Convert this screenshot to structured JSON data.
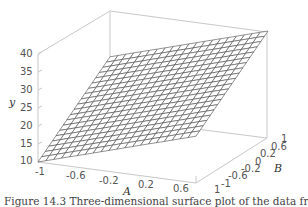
{
  "chart_data": {
    "type": "surface3d",
    "title": "",
    "xlabel": "A",
    "ylabel": "B",
    "zlabel": "y",
    "x_ticks": [
      "-1",
      "-0.6",
      "-0.2",
      "0.2",
      "0.6",
      "1"
    ],
    "y_ticks": [
      "-1",
      "-0.6",
      "-0.2",
      "0",
      "0.2",
      "0.6",
      "1"
    ],
    "z_ticks": [
      "10",
      "15",
      "20",
      "25",
      "30",
      "35",
      "40"
    ],
    "xlim": [
      -1,
      1
    ],
    "ylim": [
      -1,
      1
    ],
    "zlim": [
      10,
      40
    ],
    "grid": false,
    "surface": {
      "description": "planar wireframe surface, lowest at A=-1,B=-1 and highest at A=1,B=1",
      "corners": [
        {
          "A": -1,
          "B": -1,
          "y": 10
        },
        {
          "A": -1,
          "B": 1,
          "y": 27
        },
        {
          "A": 1,
          "B": 1,
          "y": 40
        },
        {
          "A": 1,
          "B": -1,
          "y": 23
        }
      ],
      "mesh_lines": 20
    }
  },
  "axes": {
    "z_label": "y",
    "x_label": "A",
    "y_label": "B",
    "z_ticks": [
      "40",
      "35",
      "30",
      "25",
      "20",
      "15",
      "10"
    ],
    "x_ticks": [
      "-1",
      "-0.6",
      "-0.2",
      "0.2",
      "0.6",
      "1"
    ],
    "y_ticks": [
      "-1",
      "-0.6",
      "-0.2",
      "0",
      "0.2",
      "0.6",
      "1"
    ]
  },
  "caption": "Figure 14.3   Three-dimensional surface plot of the data from",
  "colors": {
    "box": "#c8c8c8",
    "mesh": "#555555",
    "text": "#555555"
  }
}
